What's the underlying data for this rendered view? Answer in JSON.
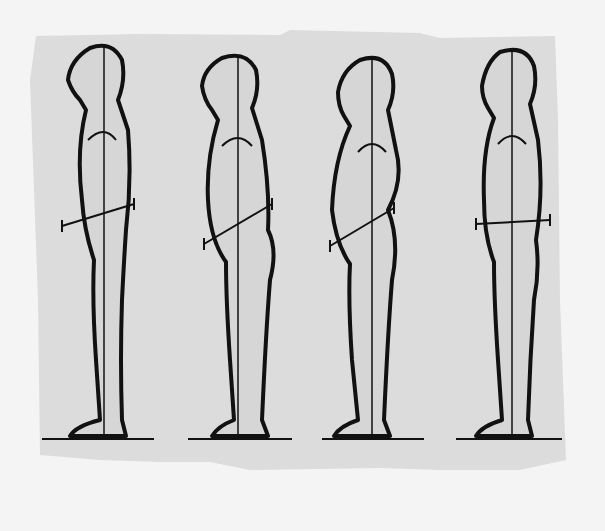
{
  "illustration": {
    "title": "Four standing posture profiles",
    "colors": {
      "page": "#f4f4f4",
      "panel": "#dcdcdc",
      "figure_fill": "#d6d6d6",
      "outline": "#111111"
    },
    "figures": [
      {
        "id": 1,
        "plumb_x": 104,
        "pelvis_tilt": "neutral"
      },
      {
        "id": 2,
        "plumb_x": 238,
        "pelvis_tilt": "anterior"
      },
      {
        "id": 3,
        "plumb_x": 372,
        "pelvis_tilt": "anterior-sway"
      },
      {
        "id": 4,
        "plumb_x": 512,
        "pelvis_tilt": "posterior"
      }
    ]
  }
}
